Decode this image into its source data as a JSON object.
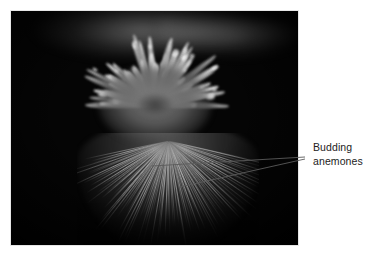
{
  "figure": {
    "kind": "annotated-photograph",
    "background_color": "#ffffff"
  },
  "photo": {
    "alt": "Dark underwater photograph of a pale sea anemone with many radiating tentacles tipped in bright white, sitting on a striated column base",
    "background_color": "#050505",
    "tentacle_color": "#b4b4b4",
    "tip_color": "#ffffff",
    "frame": {
      "x": 11,
      "y": 11,
      "width": 287,
      "height": 234
    }
  },
  "callout": {
    "label_lines": [
      "Budding",
      "anemones"
    ],
    "text_color": "#222222",
    "line_color": "#5a5a5a",
    "leaders": [
      {
        "name": "upper-leader",
        "x1": 152,
        "y1": 166,
        "x2": 305,
        "y2": 157
      },
      {
        "name": "lower-leader",
        "x1": 180,
        "y1": 187,
        "x2": 305,
        "y2": 159
      }
    ]
  }
}
